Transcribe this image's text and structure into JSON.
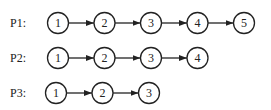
{
  "diagram": {
    "type": "linked-chains",
    "rows": [
      {
        "label": "P1:",
        "nodes": [
          "1",
          "2",
          "3",
          "4",
          "5"
        ]
      },
      {
        "label": "P2:",
        "nodes": [
          "1",
          "2",
          "3",
          "4"
        ]
      },
      {
        "label": "P3:",
        "nodes": [
          "1",
          "2",
          "3"
        ]
      }
    ],
    "edge_style": "arrow-right",
    "colors": {
      "stroke": "#222222",
      "fill": "#ffffff"
    }
  }
}
